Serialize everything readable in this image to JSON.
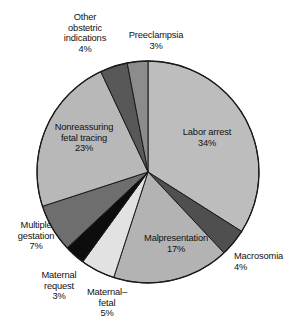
{
  "chart_data": {
    "type": "pie",
    "title": "",
    "subtitle": "",
    "xlabel": "",
    "ylabel": "",
    "legend_position": "none",
    "grid": false,
    "units": "percent",
    "start_angle_deg": 0,
    "direction": "clockwise",
    "total": 100,
    "categories": [
      "Labor arrest",
      "Macrosomia",
      "Malpresentation",
      "Maternal–fetal",
      "Maternal request",
      "Multiple gestation",
      "Nonreassuring fetal tracing",
      "Other obstetric indications",
      "Preeclampsia"
    ],
    "values": [
      34,
      4,
      17,
      5,
      3,
      7,
      23,
      4,
      3
    ],
    "colors": [
      "#bdbdbd",
      "#4f4f4f",
      "#b3b3b3",
      "#e2e2e2",
      "#0d0d0d",
      "#6e6e6e",
      "#b8b8b8",
      "#585858",
      "#8c8c8c"
    ],
    "slices": [
      {
        "name": "Labor arrest",
        "value": 34,
        "value_label": "34%",
        "color": "#bdbdbd",
        "label_lines": [
          "Labor arrest"
        ]
      },
      {
        "name": "Macrosomia",
        "value": 4,
        "value_label": "4%",
        "color": "#4f4f4f",
        "label_lines": [
          "Macrosomia"
        ]
      },
      {
        "name": "Malpresentation",
        "value": 17,
        "value_label": "17%",
        "color": "#b3b3b3",
        "label_lines": [
          "Malpresentation"
        ]
      },
      {
        "name": "Maternal–fetal",
        "value": 5,
        "value_label": "5%",
        "color": "#e2e2e2",
        "label_lines": [
          "Maternal–",
          "fetal"
        ]
      },
      {
        "name": "Maternal request",
        "value": 3,
        "value_label": "3%",
        "color": "#0d0d0d",
        "label_lines": [
          "Maternal",
          "request"
        ]
      },
      {
        "name": "Multiple gestation",
        "value": 7,
        "value_label": "7%",
        "color": "#6e6e6e",
        "label_lines": [
          "Multiple",
          "gestation"
        ]
      },
      {
        "name": "Nonreassuring fetal tracing",
        "value": 23,
        "value_label": "23%",
        "color": "#b8b8b8",
        "label_lines": [
          "Nonreassuring",
          "fetal tracing"
        ]
      },
      {
        "name": "Other obstetric indications",
        "value": 4,
        "value_label": "4%",
        "color": "#585858",
        "label_lines": [
          "Other",
          "obstetric",
          "indications"
        ]
      },
      {
        "name": "Preeclampsia",
        "value": 3,
        "value_label": "3%",
        "color": "#8c8c8c",
        "label_lines": [
          "Preeclampsia"
        ]
      }
    ]
  },
  "labels": {
    "other": {
      "l1": "Other",
      "l2": "obstetric",
      "l3": "indications",
      "val": "4%"
    },
    "preeclampsia": {
      "l1": "Preeclampsia",
      "val": "3%"
    },
    "labor_arrest": {
      "l1": "Labor arrest",
      "val": "34%"
    },
    "macrosomia": {
      "l1": "Macrosomia",
      "val": "4%"
    },
    "malpresentation": {
      "l1": "Malpresentation",
      "val": "17%"
    },
    "maternal_fetal": {
      "l1": "Maternal–",
      "l2": "fetal",
      "val": "5%"
    },
    "maternal_request": {
      "l1": "Maternal",
      "l2": "request",
      "val": "3%"
    },
    "multiple_gestation": {
      "l1": "Multiple",
      "l2": "gestation",
      "val": "7%"
    },
    "nonreassuring": {
      "l1": "Nonreassuring",
      "l2": "fetal tracing",
      "val": "23%"
    }
  },
  "style": {
    "outline_color": "#1a1a1a",
    "background": "#ffffff",
    "text_color": "#111111"
  },
  "geometry": {
    "center_x": 148,
    "center_y": 172,
    "radius": 111
  }
}
